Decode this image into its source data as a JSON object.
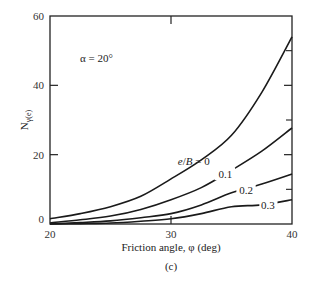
{
  "chart_data": {
    "type": "line",
    "title": "",
    "caption": "(c)",
    "xlabel": "Friction angle, φ (deg)",
    "ylabel": "Nγ(e)",
    "ylabel_main": "N",
    "ylabel_sub": "γ(e)",
    "xlim": [
      20,
      40
    ],
    "ylim": [
      0,
      60
    ],
    "x_ticks": [
      20,
      30,
      40
    ],
    "y_ticks": [
      0,
      20,
      40,
      60
    ],
    "grid": false,
    "annotation": "α = 20°",
    "x": [
      20,
      22.5,
      25,
      27.5,
      30,
      32.5,
      35,
      37.5,
      40
    ],
    "series": [
      {
        "name": "e/B = 0",
        "label": "e/B = 0",
        "values": [
          1.5,
          3.0,
          5.0,
          8.0,
          13.0,
          18.5,
          25.6,
          38.0,
          54.0
        ]
      },
      {
        "name": "e/B = 0.1",
        "label": "0.1",
        "values": [
          0.3,
          1.2,
          2.3,
          4.2,
          7.0,
          10.5,
          15.5,
          21.0,
          27.7
        ]
      },
      {
        "name": "e/B = 0.2",
        "label": "0.2",
        "values": [
          0.0,
          0.4,
          0.9,
          1.8,
          3.0,
          5.5,
          9.0,
          11.5,
          14.4
        ]
      },
      {
        "name": "e/B = 0.3",
        "label": "0.3",
        "values": [
          0.0,
          0.1,
          0.3,
          0.8,
          1.5,
          3.0,
          5.0,
          5.5,
          7.0
        ]
      }
    ]
  }
}
